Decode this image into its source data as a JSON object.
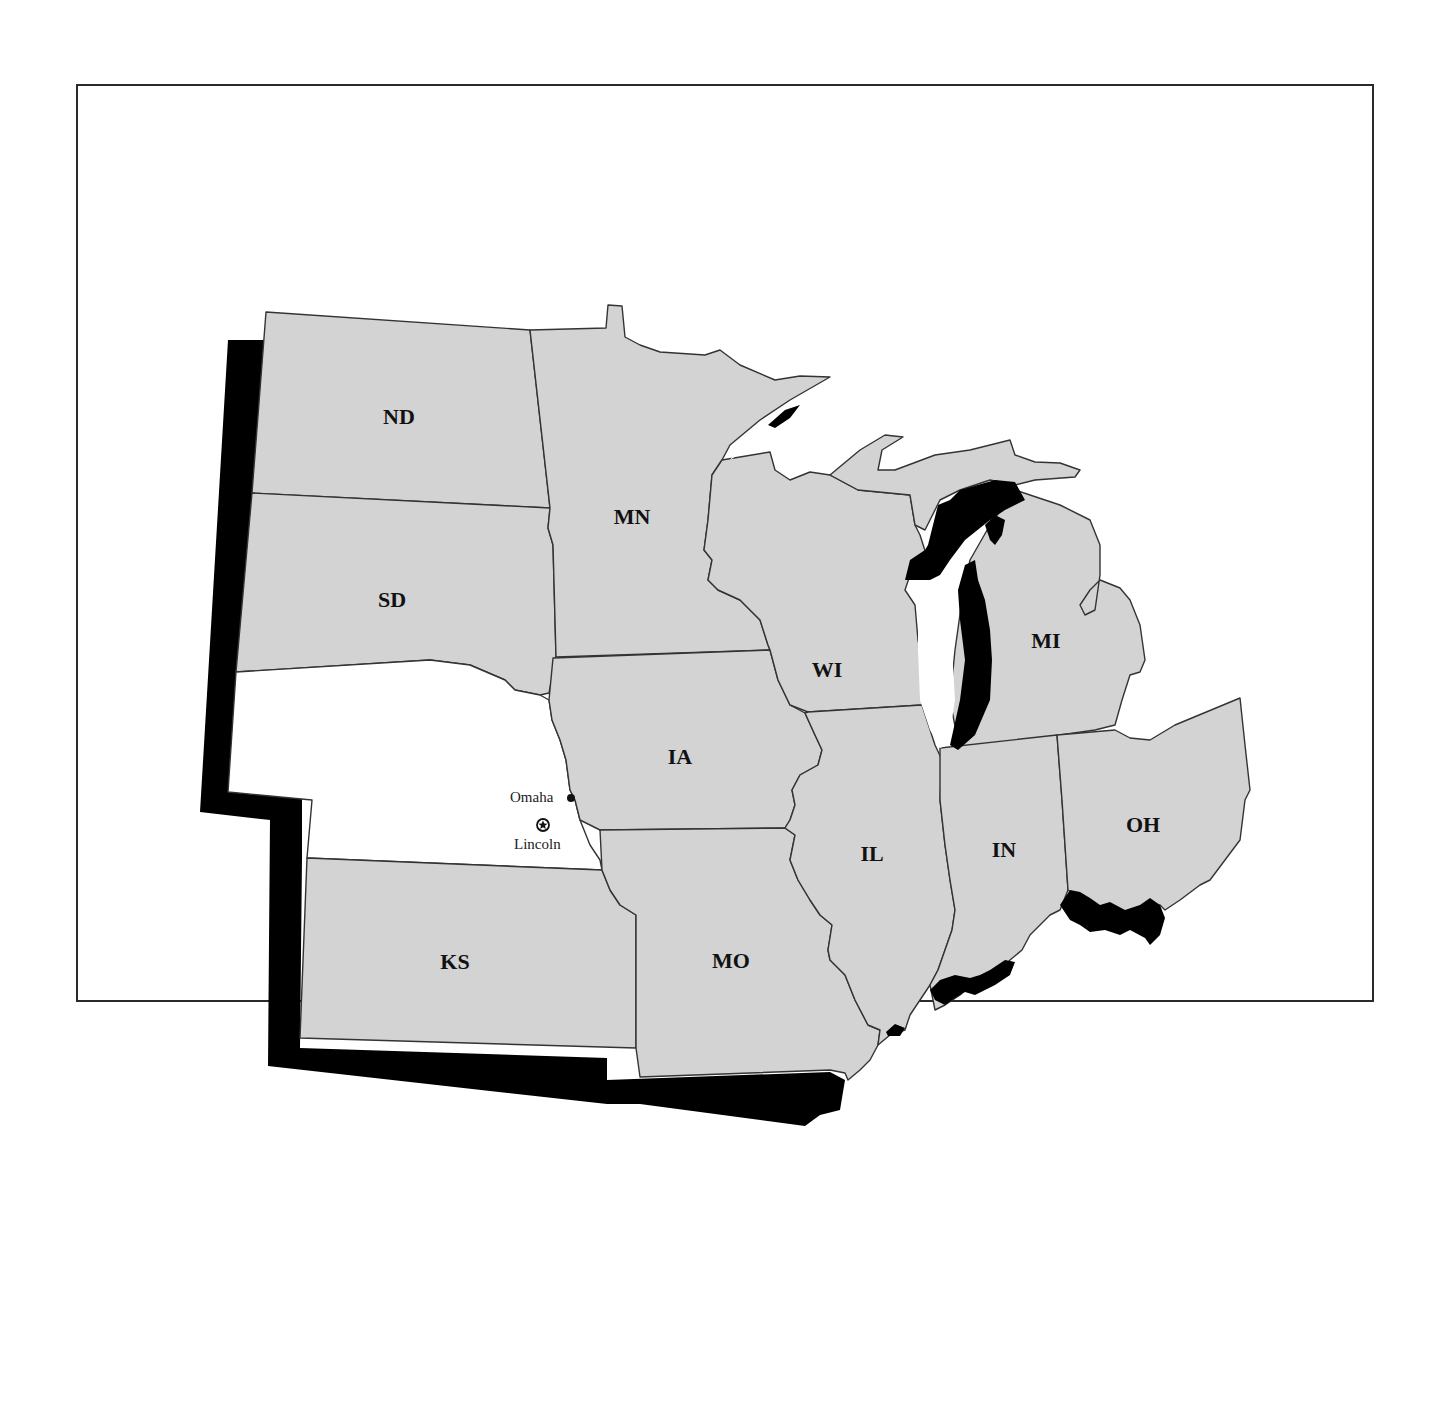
{
  "map": {
    "title": "",
    "region": "Midwest United States",
    "highlighted_state": "NE",
    "colors": {
      "state_fill": "#d3d3d3",
      "highlight_fill": "#ffffff",
      "border": "#333333",
      "shadow": "#000000",
      "water": "#ffffff"
    },
    "states": [
      {
        "abbr": "ND",
        "label": "ND"
      },
      {
        "abbr": "SD",
        "label": "SD"
      },
      {
        "abbr": "NE",
        "label": ""
      },
      {
        "abbr": "KS",
        "label": "KS"
      },
      {
        "abbr": "MN",
        "label": "MN"
      },
      {
        "abbr": "IA",
        "label": "IA"
      },
      {
        "abbr": "MO",
        "label": "MO"
      },
      {
        "abbr": "WI",
        "label": "WI"
      },
      {
        "abbr": "IL",
        "label": "IL"
      },
      {
        "abbr": "MI",
        "label": "MI"
      },
      {
        "abbr": "IN",
        "label": "IN"
      },
      {
        "abbr": "OH",
        "label": "OH"
      }
    ],
    "cities": [
      {
        "name": "Omaha",
        "type": "city",
        "icon": "dot-icon"
      },
      {
        "name": "Lincoln",
        "type": "capital",
        "icon": "star-in-circle-icon"
      }
    ]
  }
}
